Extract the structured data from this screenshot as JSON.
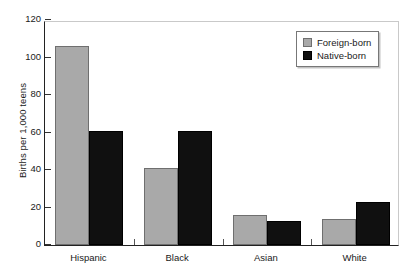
{
  "chart_data": {
    "type": "bar",
    "title": "",
    "xlabel": "",
    "ylabel": "Births per 1,000 teens",
    "ylim": [
      0,
      120
    ],
    "ytick_labels": [
      "0",
      "20",
      "40",
      "60",
      "80",
      "100",
      "120"
    ],
    "ytick_values": [
      0,
      20,
      40,
      60,
      80,
      100,
      120
    ],
    "grid": false,
    "legend_position": "top-right",
    "categories": [
      "Hispanic",
      "Black",
      "Asian",
      "White"
    ],
    "series": [
      {
        "name": "Foreign-born",
        "color": "#a9a9a9",
        "values": [
          106,
          41,
          16,
          14
        ]
      },
      {
        "name": "Native-born",
        "color": "#101010",
        "values": [
          61,
          61,
          13,
          23
        ]
      }
    ]
  },
  "legend": {
    "entries": [
      {
        "label": "Foreign-born",
        "swatch": "foreign"
      },
      {
        "label": "Native-born",
        "swatch": "native"
      }
    ]
  }
}
